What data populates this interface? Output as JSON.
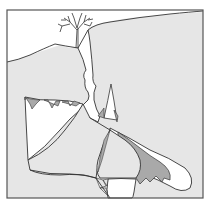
{
  "figure": {
    "colors": {
      "background": "#ffffff",
      "rock": "#e6e6e6",
      "sediment": "#a9a9a9",
      "line": "#333333",
      "frame": "#555555"
    },
    "elements": [
      {
        "name": "tree",
        "label": "Tree on surface"
      },
      {
        "name": "ground-surface",
        "label": "Ground surface"
      },
      {
        "name": "vertical-shaft",
        "label": "Vertical solution shaft"
      },
      {
        "name": "upper-cave-chamber",
        "label": "Upper cave chamber"
      },
      {
        "name": "stalactites",
        "label": "Ceiling deposits"
      },
      {
        "name": "stalagmite",
        "label": "Stalagmite"
      },
      {
        "name": "collapse-block",
        "label": "Collapsed breakdown block"
      },
      {
        "name": "lower-passage",
        "label": "Lower sloping passage"
      },
      {
        "name": "sediment-fill",
        "label": "Sediment fill"
      },
      {
        "name": "bottom-chamber",
        "label": "Bottom chamber"
      }
    ]
  }
}
